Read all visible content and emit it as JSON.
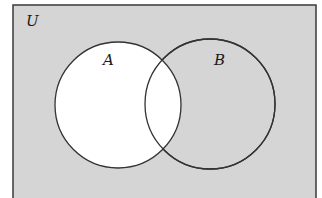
{
  "diagram": {
    "type": "venn",
    "universe": {
      "label": "U",
      "rect": {
        "x": 13,
        "y": 5,
        "width": 303,
        "height": 196
      },
      "fill": "#d5d5d5",
      "stroke": "#3a3a3a"
    },
    "sets": [
      {
        "label": "A",
        "cx": 118,
        "cy": 105,
        "r": 63,
        "fill": "#ffffff",
        "label_pos": {
          "x": 108,
          "y": 65
        }
      },
      {
        "label": "B",
        "cx": 210,
        "cy": 104,
        "r": 65,
        "fill": "#d5d5d5",
        "label_pos": {
          "x": 219,
          "y": 65
        }
      }
    ],
    "shaded_regions": [
      "U minus A"
    ],
    "unshaded_regions": [
      "A"
    ],
    "stroke_color": "#333333"
  }
}
